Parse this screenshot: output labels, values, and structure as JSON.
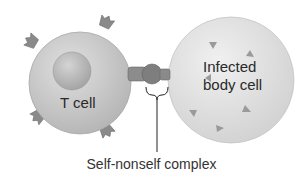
{
  "diagram": {
    "type": "biology-illustration",
    "cells": [
      {
        "id": "t-cell",
        "label": "T cell"
      },
      {
        "id": "infected-cell",
        "label_line1": "Infected",
        "label_line2": "body cell"
      }
    ],
    "caption": "Self-nonself complex",
    "colors": {
      "cell_fill": "#c8c8c8",
      "infected_fill": "#dedede",
      "nucleus": "#b0b0b0",
      "receptor": "#8a8a8a",
      "antigen": "#9a9a9a",
      "text": "#2a2a2a"
    }
  }
}
